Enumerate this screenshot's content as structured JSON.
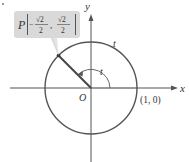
{
  "diagram": {
    "type": "unit-circle",
    "axes": {
      "x_label": "x",
      "y_label": "y",
      "origin_label": "O"
    },
    "point_one_zero": "(1, 0)",
    "arc_label": "t",
    "angle_label": "t",
    "point": {
      "name": "P",
      "x_num": "√2",
      "x_den": "2",
      "x_sign": "−",
      "y_num": "√2",
      "y_den": "2",
      "comma": ","
    },
    "colors": {
      "circle": "#555555",
      "axes": "#555555",
      "radius": "#444444",
      "label_box": "#d9d9d9"
    }
  }
}
